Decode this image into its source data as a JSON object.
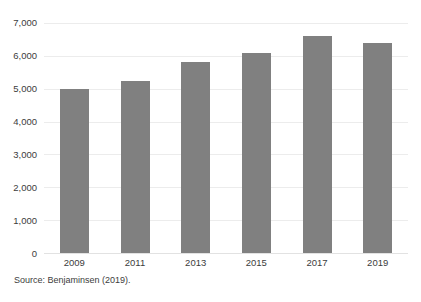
{
  "figure": {
    "title_fragment": "",
    "background_color": "#ffffff",
    "source_note": "Source: Benjaminsen (2019)."
  },
  "chart_data": {
    "type": "bar",
    "title": "",
    "subtitle": "",
    "xlabel": "",
    "ylabel": "",
    "categories": [
      "2009",
      "2011",
      "2013",
      "2015",
      "2017",
      "2019"
    ],
    "values": [
      5000,
      5250,
      5800,
      6100,
      6600,
      6400
    ],
    "series": [
      {
        "name": "",
        "values": [
          5000,
          5250,
          5800,
          6100,
          6600,
          6400
        ],
        "color": "#808080"
      }
    ],
    "ylim": [
      0,
      7000
    ],
    "ytick_values": [
      0,
      1000,
      2000,
      3000,
      4000,
      5000,
      6000,
      7000
    ],
    "ytick_labels": [
      "0",
      "1,000",
      "2,000",
      "3,000",
      "4,000",
      "5,000",
      "6,000",
      "7,000"
    ],
    "xtick_labels": [
      "2009",
      "2011",
      "2013",
      "2015",
      "2017",
      "2019"
    ],
    "grid": true,
    "grid_axis": "y",
    "grid_color": "#ececec",
    "legend": false,
    "legend_position": "none",
    "bar_color": "#808080",
    "annotations": []
  }
}
